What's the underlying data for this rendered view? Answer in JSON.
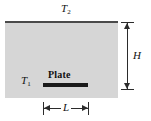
{
  "figure": {
    "type": "heat-transfer-schematic",
    "colors": {
      "medium_fill": "#d6d6d6",
      "boundary_line": "#4a4a4a",
      "plate": "#1a1a1a",
      "dimension_line": "#2b2b2b",
      "text": "#111111",
      "background": "#ffffff"
    }
  },
  "labels": {
    "temperature_top": "T",
    "temperature_top_sub": "2",
    "temperature_bottom": "T",
    "temperature_bottom_sub": "1",
    "plate": "Plate",
    "height_dimension": "H",
    "length_dimension": "L"
  }
}
